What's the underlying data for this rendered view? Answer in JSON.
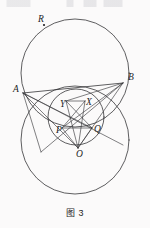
{
  "page": {
    "background_color": "#fbfafa",
    "ink_color": "#2a2a2c",
    "width": 150,
    "height": 228
  },
  "caption": {
    "text": "图 3",
    "figure_number": "3"
  },
  "figure": {
    "kind": "geometry-diagram",
    "labels": [
      {
        "name": "R",
        "text": "R",
        "x": 38,
        "y": 22,
        "has_point_marker": true,
        "point_x": 44,
        "point_y": 25
      },
      {
        "name": "A",
        "text": "A",
        "x": 13,
        "y": 92,
        "has_point_marker": false,
        "point_x": 23,
        "point_y": 93
      },
      {
        "name": "B",
        "text": "B",
        "x": 128,
        "y": 80,
        "has_point_marker": false,
        "point_x": 123,
        "point_y": 83
      },
      {
        "name": "Y",
        "text": "Y",
        "x": 60,
        "y": 107,
        "has_point_marker": false,
        "point_x": 66,
        "point_y": 101
      },
      {
        "name": "X",
        "text": "X",
        "x": 86,
        "y": 105,
        "has_point_marker": false,
        "point_x": 85,
        "point_y": 101
      },
      {
        "name": "P",
        "text": "P",
        "x": 56,
        "y": 133,
        "has_point_marker": false,
        "point_x": 62,
        "point_y": 128
      },
      {
        "name": "Q",
        "text": "Q",
        "x": 94,
        "y": 132,
        "has_point_marker": false,
        "point_x": 92,
        "point_y": 128
      },
      {
        "name": "O",
        "text": "O",
        "x": 76,
        "y": 157,
        "has_point_marker": false,
        "point_x": 78,
        "point_y": 148
      }
    ],
    "circles": [
      {
        "name": "upper-circle",
        "cx": 75,
        "cy": 73,
        "r": 54
      },
      {
        "name": "lower-circle",
        "cx": 75,
        "cy": 140,
        "r": 54
      },
      {
        "name": "inner-circle",
        "cx": 76,
        "cy": 117,
        "r": 28
      }
    ]
  }
}
